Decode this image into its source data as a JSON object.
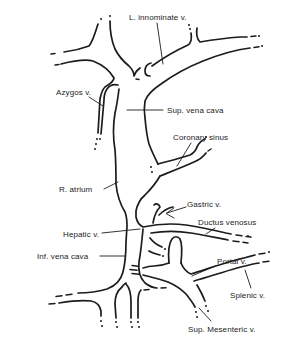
{
  "figure": {
    "background_color": "#ffffff",
    "ink_color": "#1c1c1c",
    "labels": [
      {
        "id": "l-innominate-v",
        "text": "L. innominate v."
      },
      {
        "id": "azygos-v",
        "text": "Azygos v."
      },
      {
        "id": "sup-vena-cava",
        "text": "Sup. vena cava"
      },
      {
        "id": "coronary-sinus",
        "text": "Coronary sinus"
      },
      {
        "id": "r-atrium",
        "text": "R. atrium"
      },
      {
        "id": "gastric-v",
        "text": "Gastric v."
      },
      {
        "id": "ductus-venosus",
        "text": "Ductus venosus"
      },
      {
        "id": "hepatic-v",
        "text": "Hepatic v."
      },
      {
        "id": "inf-vena-cava",
        "text": "Inf. vena cava"
      },
      {
        "id": "portal-v",
        "text": "Portal v."
      },
      {
        "id": "splenic-v",
        "text": "Splenic v."
      },
      {
        "id": "sup-mesenteric-v",
        "text": "Sup. Mesenteric v."
      }
    ],
    "pointer_styles": {
      "gastric_v": "arrow",
      "default": "plain-line"
    }
  }
}
